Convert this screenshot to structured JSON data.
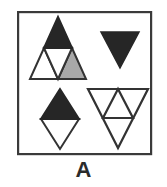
{
  "figure": {
    "label": "A",
    "background_color": "#ffffff",
    "stroke_color": "#333333",
    "fill_black": "#262626",
    "fill_gray": "#a8a8a8",
    "fill_white": "#ffffff",
    "frame": {
      "x": 17,
      "y": 11,
      "width": 135,
      "height": 144,
      "stroke_width": 2.2
    },
    "shapes": [
      {
        "name": "subdivided-triangle-top-left",
        "description": "Large upward triangle subdivided into four sub-triangles",
        "orientation": "up",
        "apex": [
          56,
          17
        ],
        "base_left": [
          30,
          79
        ],
        "base_right": [
          86,
          79
        ],
        "parts": [
          {
            "name": "top-sub-triangle",
            "orientation": "up",
            "fill": "#262626"
          },
          {
            "name": "bottom-left-sub-triangle",
            "orientation": "up",
            "fill": "#ffffff"
          },
          {
            "name": "center-sub-triangle",
            "orientation": "down",
            "fill": "#ffffff"
          },
          {
            "name": "bottom-right-sub-triangle",
            "orientation": "up",
            "fill": "#a8a8a8"
          }
        ]
      },
      {
        "name": "solid-inverted-triangle-top-right",
        "description": "Solid black downward pointing triangle",
        "orientation": "down",
        "top_left": [
          101,
          32
        ],
        "top_right": [
          139,
          32
        ],
        "apex": [
          120,
          68
        ],
        "fill": "#262626"
      },
      {
        "name": "rhombus-bottom-left",
        "description": "Rhombus: black upward triangle above white downward triangle outline",
        "top_apex": [
          60,
          89
        ],
        "left": [
          41,
          119
        ],
        "right": [
          79,
          119
        ],
        "bottom_apex": [
          60,
          149
        ],
        "parts": [
          {
            "name": "upper-half-triangle",
            "orientation": "up",
            "fill": "#262626"
          },
          {
            "name": "lower-half-triangle",
            "orientation": "down",
            "fill": "#ffffff"
          }
        ]
      },
      {
        "name": "subdivided-inverted-triangle-bottom-right",
        "description": "Large downward triangle outline containing an inner upward triangle at the side midpoints",
        "orientation": "down",
        "top_left": [
          88,
          89
        ],
        "top_right": [
          148,
          89
        ],
        "apex": [
          118,
          148
        ],
        "inner_triangle": {
          "name": "inner-upward-triangle",
          "orientation": "up",
          "apex": [
            118,
            89
          ],
          "base_left": [
            103,
            118
          ],
          "base_right": [
            133,
            118
          ]
        },
        "fill": "#ffffff"
      }
    ]
  }
}
